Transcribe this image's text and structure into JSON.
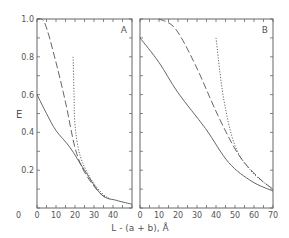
{
  "figure": {
    "ylabel": "E",
    "xlabel": "L - (a + b), Å",
    "colors": {
      "line": "#555555",
      "frame": "#666666",
      "text": "#555555"
    }
  },
  "chart_data": [
    {
      "type": "line",
      "panel_label": "A",
      "xlabel": "L - (a + b), Å",
      "ylabel": "E",
      "xlim": [
        0,
        50
      ],
      "ylim": [
        0,
        1.0
      ],
      "xticks": [
        0,
        10,
        20,
        30,
        40
      ],
      "xtick_labels": [
        "0",
        "10",
        "20",
        "30",
        "40"
      ],
      "yticks": [
        0,
        0.2,
        0.4,
        0.6,
        0.8,
        1.0
      ],
      "ytick_labels": [
        "0",
        "0.2",
        "0.4",
        "0.6",
        "0.8",
        "1.0"
      ],
      "grid": false,
      "legend": null,
      "series": [
        {
          "name": "solid",
          "style": "solid",
          "x": [
            0,
            5,
            10,
            17.4,
            25,
            34,
            42,
            50
          ],
          "y": [
            0.6,
            0.5,
            0.41,
            0.32,
            0.2,
            0.07,
            0.04,
            0.02
          ]
        },
        {
          "name": "dashed",
          "style": "dashed",
          "x": [
            0,
            4,
            9.5,
            15,
            20,
            25,
            33,
            38
          ],
          "y": [
            1.0,
            0.98,
            0.79,
            0.56,
            0.32,
            0.19,
            0.08,
            0.05
          ]
        },
        {
          "name": "dotted",
          "style": "dotted",
          "x": [
            19,
            19.5,
            20,
            22.6,
            28,
            34,
            38
          ],
          "y": [
            0.8,
            0.6,
            0.44,
            0.28,
            0.16,
            0.08,
            0.05
          ]
        }
      ]
    },
    {
      "type": "line",
      "panel_label": "B",
      "xlabel": "L - (a + b), Å",
      "ylabel": "E",
      "xlim": [
        0,
        70
      ],
      "ylim": [
        0,
        1.0
      ],
      "xticks": [
        0,
        10,
        20,
        30,
        40,
        50,
        60,
        70
      ],
      "xtick_labels": [
        "0",
        "10",
        "20",
        "30",
        "40",
        "50",
        "60",
        "70"
      ],
      "yticks": [
        0,
        0.2,
        0.4,
        0.6,
        0.8,
        1.0
      ],
      "grid": false,
      "legend": null,
      "series": [
        {
          "name": "solid",
          "style": "solid",
          "x": [
            0,
            10,
            20,
            34.5,
            46.7,
            59,
            70
          ],
          "y": [
            0.9,
            0.77,
            0.61,
            0.42,
            0.24,
            0.14,
            0.09
          ]
        },
        {
          "name": "dashed",
          "style": "dashed",
          "x": [
            10,
            18.5,
            29,
            41,
            52,
            62.5,
            70
          ],
          "y": [
            1.0,
            0.95,
            0.76,
            0.49,
            0.28,
            0.16,
            0.1
          ]
        },
        {
          "name": "dotted",
          "style": "dotted",
          "x": [
            40,
            44,
            50,
            59,
            70
          ],
          "y": [
            0.9,
            0.58,
            0.33,
            0.19,
            0.1
          ]
        }
      ]
    }
  ]
}
